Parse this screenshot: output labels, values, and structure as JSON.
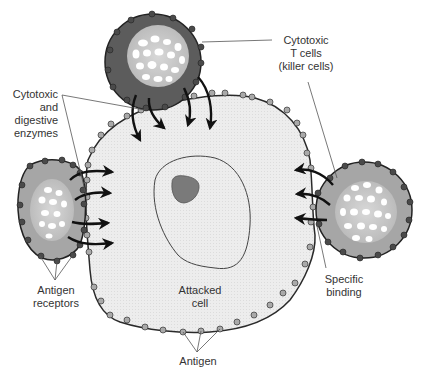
{
  "labels": {
    "tcells_line1": "Cytotoxic",
    "tcells_line2": "T cells",
    "tcells_line3": "(killer cells)",
    "enzymes_line1": "Cytotoxic",
    "enzymes_line2": "and",
    "enzymes_line3": "digestive",
    "enzymes_line4": "enzymes",
    "receptors_line1": "Antigen",
    "receptors_line2": "receptors",
    "attacked_line1": "Attacked",
    "attacked_line2": "cell",
    "binding_line1": "Specific",
    "binding_line2": "binding",
    "antigen": "Antigen"
  },
  "colors": {
    "background": "#ffffff",
    "attacked_cell_fill": "#ececec",
    "membrane_stroke": "#2a2a2a",
    "antigen_dot": "#a9a9a9",
    "receptor_dot": "#4a4a4a",
    "top_tcell_fill": "#5c5c5c",
    "side_tcell_fill": "#a6a6a6",
    "nucleolus": "#7a7a7a",
    "arrow": "#111111"
  }
}
